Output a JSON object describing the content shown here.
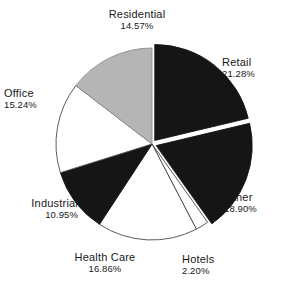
{
  "chart_data": {
    "type": "pie",
    "title": "",
    "subtitle": "",
    "xlabel": "",
    "ylabel": "",
    "legend_position": "none",
    "grid": false,
    "labels_outside": true,
    "start_angle_deg": 0,
    "direction": "clockwise",
    "categories": [
      "Retail",
      "Other",
      "Hotels",
      "Health Care",
      "Industrial",
      "Office",
      "Residential"
    ],
    "values": [
      21.28,
      18.9,
      2.2,
      16.86,
      10.95,
      15.24,
      14.57
    ],
    "value_suffix": "%",
    "total": 100.0,
    "slices": [
      {
        "label": "Retail",
        "value": 21.28,
        "value_text": "21.28%",
        "fill": "#151515",
        "stroke": "#151515",
        "angle_deg": 76.6,
        "start_deg": 0.0,
        "end_deg": 76.6,
        "exploded": true,
        "label_anchor": "left"
      },
      {
        "label": "Other",
        "value": 18.9,
        "value_text": "18.90%",
        "fill": "#151515",
        "stroke": "#151515",
        "angle_deg": 68.0,
        "start_deg": 76.6,
        "end_deg": 144.6,
        "exploded": true,
        "label_anchor": "left"
      },
      {
        "label": "Hotels",
        "value": 2.2,
        "value_text": "2.20%",
        "fill": "#ffffff",
        "stroke": "#4a4a4a",
        "angle_deg": 7.9,
        "start_deg": 144.6,
        "end_deg": 152.5,
        "exploded": false,
        "label_anchor": "left"
      },
      {
        "label": "Health Care",
        "value": 16.86,
        "value_text": "16.86%",
        "fill": "#ffffff",
        "stroke": "#4a4a4a",
        "angle_deg": 60.7,
        "start_deg": 152.5,
        "end_deg": 213.2,
        "exploded": false,
        "label_anchor": "center"
      },
      {
        "label": "Industrial",
        "value": 10.95,
        "value_text": "10.95%",
        "fill": "#151515",
        "stroke": "#151515",
        "angle_deg": 39.4,
        "start_deg": 213.2,
        "end_deg": 252.6,
        "exploded": false,
        "label_anchor": "right"
      },
      {
        "label": "Office",
        "value": 15.24,
        "value_text": "15.24%",
        "fill": "#ffffff",
        "stroke": "#4a4a4a",
        "angle_deg": 54.9,
        "start_deg": 252.6,
        "end_deg": 307.5,
        "exploded": false,
        "label_anchor": "left"
      },
      {
        "label": "Residential",
        "value": 14.57,
        "value_text": "14.57%",
        "fill": "#b5b5b5",
        "stroke": "#8f8f8f",
        "angle_deg": 52.5,
        "start_deg": 307.5,
        "end_deg": 360.0,
        "exploded": false,
        "label_anchor": "center"
      }
    ],
    "colors": {
      "black_slice": "#151515",
      "white_slice": "#ffffff",
      "gray_slice": "#b5b5b5",
      "outline": "#4a4a4a",
      "background": "#ffffff",
      "text": "#181818"
    },
    "geometry": {
      "center_x": 152,
      "center_y": 144,
      "radius": 96
    }
  }
}
